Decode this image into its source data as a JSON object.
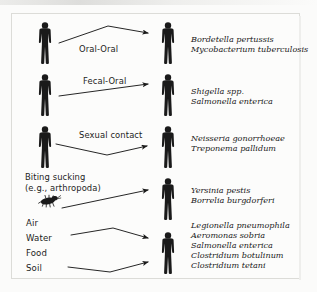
{
  "figure": {
    "background_color": "#fbfbfa",
    "ink_color": "#1a1a1a",
    "person_icon": "person-silhouette-icon",
    "arthropod_icon": "arthropod-icon"
  },
  "rows": [
    {
      "id": "oral-oral",
      "route_label": "Oral-Oral",
      "source_type": "person",
      "arrow": "peak",
      "organisms": [
        "Bordetella pertussis",
        "Mycobacterium tuberculosis"
      ]
    },
    {
      "id": "fecal-oral",
      "route_label": "Fecal-Oral",
      "source_type": "person",
      "arrow": "straight-up",
      "organisms": [
        "Shigella spp.",
        "Salmonella enterica"
      ]
    },
    {
      "id": "sexual-contact",
      "route_label": "Sexual contact",
      "source_type": "person",
      "arrow": "valley",
      "organisms": [
        "Neisseria gonorrhoeae",
        "Treponema pallidum"
      ]
    },
    {
      "id": "biting-sucking",
      "route_label_line1": "Biting sucking",
      "route_label_line2": "(e.g., arthropoda)",
      "source_type": "arthropod",
      "arrow": "straight-up",
      "organisms": [
        "Yersinia pestis",
        "Borrelia burgdorferi"
      ]
    },
    {
      "id": "environmental",
      "sources": [
        "Air",
        "Water",
        "Food",
        "Soil"
      ],
      "source_type": "environment",
      "arrow": "converging-pair",
      "organisms": [
        "Legionella pneumophila",
        "Aeromonas sobria",
        "Salmonella enterica",
        "Clostridium botulinum",
        "Clostridium tetani"
      ]
    }
  ]
}
